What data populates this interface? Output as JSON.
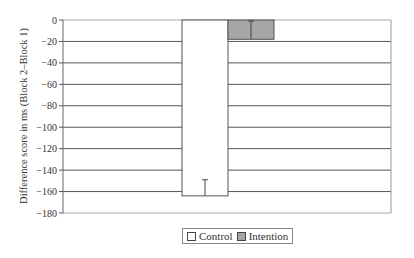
{
  "chart_data": {
    "type": "bar",
    "title": "",
    "xlabel": "",
    "ylabel": "Difference score in ms (Block 2–Block 1)",
    "ylim": [
      -180,
      0
    ],
    "yticks": [
      0,
      -20,
      -40,
      -60,
      -80,
      -100,
      -120,
      -140,
      -160,
      -180
    ],
    "ytick_labels": [
      "0",
      "−20",
      "−40",
      "−60",
      "−80",
      "−100",
      "−120",
      "−140",
      "−160",
      "−180"
    ],
    "grid": true,
    "legend_position": "bottom",
    "categories": [
      ""
    ],
    "series": [
      {
        "name": "Control",
        "values": [
          -164
        ],
        "error": [
          15
        ],
        "color": "#ffffff"
      },
      {
        "name": "Intention",
        "values": [
          -18
        ],
        "error": [
          17
        ],
        "color": "#a6a6a6"
      }
    ]
  },
  "legend": {
    "items": [
      {
        "label": "Control",
        "color": "#ffffff"
      },
      {
        "label": "Intention",
        "color": "#a6a6a6"
      }
    ]
  }
}
